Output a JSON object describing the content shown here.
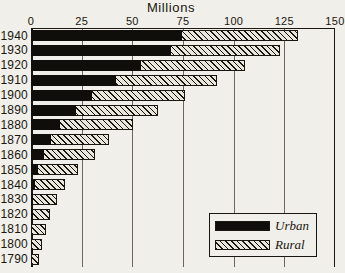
{
  "chart_data": {
    "type": "bar",
    "orientation": "horizontal",
    "stacked": true,
    "title": "Millions",
    "xlabel": "",
    "ylabel": "",
    "xlim": [
      0,
      150
    ],
    "xticks": [
      0,
      25,
      50,
      75,
      100,
      125,
      150
    ],
    "xtick_labels": [
      "0",
      "25",
      "50",
      "75",
      "100",
      "125",
      "150"
    ],
    "grid": true,
    "legend_position": "inside-right-lower",
    "categories": [
      "1940",
      "1930",
      "1920",
      "1910",
      "1900",
      "1890",
      "1880",
      "1870",
      "1860",
      "1850",
      "1840",
      "1830",
      "1820",
      "1810",
      "1800",
      "1790"
    ],
    "series": [
      {
        "name": "Urban",
        "color": "#100e0a",
        "fill": "solid",
        "values": [
          74.4,
          69.0,
          54.2,
          42.0,
          30.2,
          22.1,
          14.1,
          9.9,
          6.2,
          3.5,
          1.8,
          1.1,
          0.7,
          0.5,
          0.3,
          0.2
        ]
      },
      {
        "name": "Rural",
        "color": "#e9e6dd",
        "fill": "diagonal-hatch",
        "values": [
          57.2,
          54.0,
          51.6,
          50.0,
          45.8,
          40.8,
          36.0,
          28.7,
          25.2,
          19.6,
          15.2,
          11.7,
          8.9,
          6.7,
          5.0,
          3.7
        ]
      }
    ],
    "totals": [
      131.6,
      123.0,
      105.8,
      92.0,
      76.0,
      62.9,
      50.1,
      38.6,
      31.4,
      23.1,
      17.0,
      12.8,
      9.6,
      7.2,
      5.3,
      3.9
    ]
  },
  "legend": {
    "items": [
      {
        "label": "Urban",
        "swatch": "solid-black"
      },
      {
        "label": "Rural",
        "swatch": "hatched"
      }
    ]
  }
}
